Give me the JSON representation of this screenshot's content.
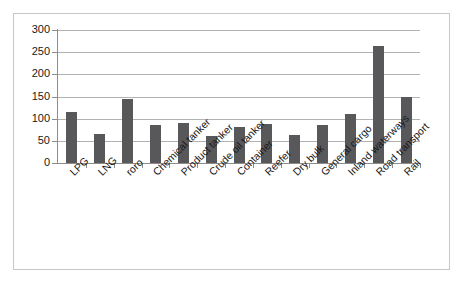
{
  "chart_data": {
    "type": "bar",
    "title": "",
    "subtitle": "",
    "xlabel": "",
    "ylabel": "",
    "ylim": [
      0,
      300
    ],
    "ytick_values": [
      0,
      50,
      100,
      150,
      200,
      250,
      300
    ],
    "ytick_labels": [
      "0",
      "50",
      "100",
      "150",
      "200",
      "250",
      "300"
    ],
    "grid": "horizontal",
    "legend": "none",
    "bar_color": "#58585a",
    "gridline_color": "#b2b2b2",
    "axis_color": "#8c8c8c",
    "frame_color": "#c8c8c8",
    "background": "#ffffff",
    "label_rotation_deg": -45,
    "categories": [
      "LPG",
      "LNG",
      "roro",
      "Chemical tanker",
      "Product tanker",
      "Crude oil tanker",
      "Container",
      "Reefer",
      "Dry bulk",
      "General cargo",
      "Inland waterways",
      "Road transport",
      "Rail"
    ],
    "values": [
      115,
      66,
      145,
      85,
      90,
      60,
      82,
      88,
      63,
      85,
      110,
      265,
      150
    ]
  }
}
